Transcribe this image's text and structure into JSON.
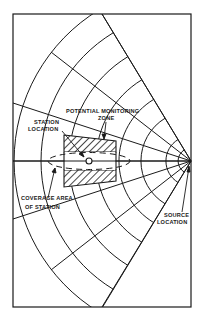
{
  "diagram": {
    "labels": {
      "potential_monitoring_zone_line1": "POTENTIAL MONITORING",
      "potential_monitoring_zone_line2": "ZONE",
      "station_location_line1": "STATION",
      "station_location_line2": "LOCATION",
      "coverage_area_line1": "COVERAGE AREA",
      "coverage_area_line2": "OF STATION",
      "source_location_line1": "SOURCE",
      "source_location_line2": "LOCATION"
    },
    "colors": {
      "line": "#1a1a1a",
      "background": "#ffffff"
    }
  }
}
